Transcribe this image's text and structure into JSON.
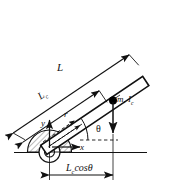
{
  "figure": {
    "colors": {
      "line": "#111111",
      "background": "#ffffff",
      "rod_fill": "#ffffff",
      "mass_dot": "#000000"
    },
    "rod": {
      "angle_label": "θ",
      "angle_degrees": 34
    },
    "labels": {
      "length_total": "L",
      "length_to_center": "L",
      "length_to_center_sub": "c",
      "radial_axis": "r",
      "vertical_axis": "y",
      "horizontal_axis": "x",
      "angle": "θ",
      "mass_inertia": "m, I",
      "mass_inertia_sub": "c",
      "horizontal_projection": "L",
      "horizontal_projection_sub": "c",
      "horizontal_projection_tail": "cosθ"
    }
  }
}
